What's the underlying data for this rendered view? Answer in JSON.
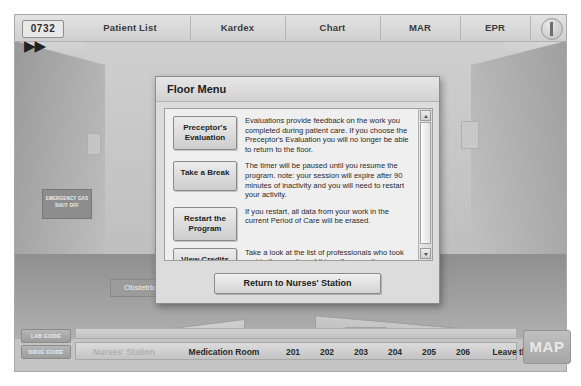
{
  "topbar": {
    "clock": "0732",
    "fast_forward_icon": "fast-forward-icon",
    "info_icon": "info-icon",
    "tabs": [
      {
        "label": "Patient List"
      },
      {
        "label": "Kardex"
      },
      {
        "label": "Chart"
      },
      {
        "label": "MAR"
      },
      {
        "label": "EPR"
      }
    ]
  },
  "scene": {
    "gas_sign": "EMERGENCY GAS SHUT OFF",
    "department_sign": "Obstetrics"
  },
  "dialog": {
    "title": "Floor Menu",
    "rows": [
      {
        "button": "Preceptor's Evaluation",
        "text": "Evaluations provide feedback on the work you completed during patient care. If you choose the Preceptor's Evaluation you will no longer be able to return to the floor."
      },
      {
        "button": "Take a Break",
        "text": "The timer will be paused until you resume the program. note: your session will expire after 90 minutes of inactivity and you will need to restart your activity."
      },
      {
        "button": "Restart the Program",
        "text": "If you restart, all data from your work in the current Period of Care will be erased."
      },
      {
        "button": "View Credits",
        "text": "Take a look at the list of professionals who took part in the creation of this software suite."
      }
    ],
    "return_button": "Return to Nurses' Station",
    "scrollbar": {
      "up_icon": "scroll-up-arrow-icon",
      "down_icon": "scroll-down-arrow-icon"
    }
  },
  "bottombar": {
    "lab_guide": "LAB GUIDE",
    "drug_guide": "DRUG GUIDE",
    "map_button": "MAP",
    "nav": [
      {
        "label": "Nurses' Station",
        "dim": true
      },
      {
        "label": "Medication Room",
        "dim": false
      },
      {
        "label": "201",
        "dim": false
      },
      {
        "label": "202",
        "dim": false
      },
      {
        "label": "203",
        "dim": false
      },
      {
        "label": "204",
        "dim": false
      },
      {
        "label": "205",
        "dim": false
      },
      {
        "label": "206",
        "dim": false
      },
      {
        "label": "Leave the Floor",
        "dim": false
      }
    ]
  }
}
